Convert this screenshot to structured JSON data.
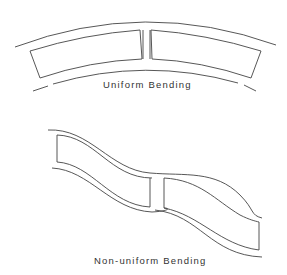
{
  "diagram": {
    "panels": [
      {
        "id": "uniform",
        "label": "Uniform Bending"
      },
      {
        "id": "non-uniform",
        "label": "Non-uniform Bending"
      }
    ],
    "stroke_color": "#444444"
  }
}
